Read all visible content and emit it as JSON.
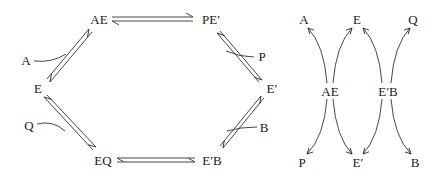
{
  "left_diagram": {
    "title": "Ping-pong bi-bi cycle",
    "nodes": [
      {
        "id": "AE",
        "label": "AE",
        "x": 99,
        "y": 19
      },
      {
        "id": "PE1",
        "label": "PE′",
        "x": 211,
        "y": 19
      },
      {
        "id": "E",
        "label": "E",
        "x": 38,
        "y": 88
      },
      {
        "id": "E1",
        "label": "E′",
        "x": 272,
        "y": 88
      },
      {
        "id": "EQ",
        "label": "EQ",
        "x": 103,
        "y": 160
      },
      {
        "id": "E1B",
        "label": "E′B",
        "x": 212,
        "y": 160
      }
    ],
    "substrates": [
      {
        "id": "A",
        "label": "A",
        "x": 26,
        "y": 60
      },
      {
        "id": "P",
        "label": "P",
        "x": 262,
        "y": 56
      },
      {
        "id": "Q",
        "label": "Q",
        "x": 29,
        "y": 125
      },
      {
        "id": "B",
        "label": "B",
        "x": 264,
        "y": 127
      }
    ],
    "equilibria": [
      {
        "from": "E",
        "to": "AE",
        "joins": "A"
      },
      {
        "from": "AE",
        "to": "PE′"
      },
      {
        "from": "PE′",
        "to": "E′",
        "leaves": "P"
      },
      {
        "from": "E′",
        "to": "E′B",
        "joins": "B"
      },
      {
        "from": "E′B",
        "to": "EQ"
      },
      {
        "from": "EQ",
        "to": "E",
        "leaves": "Q"
      }
    ]
  },
  "right_diagram": {
    "title": "Branching decomposition",
    "centers": [
      {
        "id": "AE",
        "label": "AE",
        "x": 330,
        "y": 91
      },
      {
        "id": "E1B",
        "label": "E′B",
        "x": 388,
        "y": 91
      }
    ],
    "top": [
      {
        "id": "A",
        "label": "A",
        "x": 304,
        "y": 19
      },
      {
        "id": "E",
        "label": "E",
        "x": 357,
        "y": 19
      },
      {
        "id": "Q",
        "label": "Q",
        "x": 413,
        "y": 19
      }
    ],
    "bottom": [
      {
        "id": "P",
        "label": "P",
        "x": 302,
        "y": 162
      },
      {
        "id": "E1",
        "label": "E′",
        "x": 358,
        "y": 162
      },
      {
        "id": "B",
        "label": "B",
        "x": 415,
        "y": 162
      }
    ],
    "arrows": [
      {
        "from": "AE",
        "to": "A"
      },
      {
        "from": "AE",
        "to": "E"
      },
      {
        "from": "E′B",
        "to": "E"
      },
      {
        "from": "E′B",
        "to": "Q"
      },
      {
        "from": "AE",
        "to": "P"
      },
      {
        "from": "AE",
        "to": "E′"
      },
      {
        "from": "E′B",
        "to": "E′"
      },
      {
        "from": "E′B",
        "to": "B"
      }
    ]
  }
}
